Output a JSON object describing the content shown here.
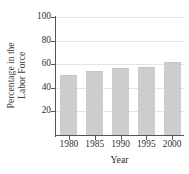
{
  "figure": {
    "caption": "Women in the Civilian Labor Force",
    "background_color": "#ffffff"
  },
  "chart_data": {
    "type": "bar",
    "title": "Women in the Civilian Labor Force",
    "xlabel": "Year",
    "ylabel": "Percentage in the Labor Force",
    "ylabel_line1": "Percentage in the",
    "ylabel_line2": "Labor Force",
    "categories": [
      "1980",
      "1985",
      "1990",
      "1995",
      "2000"
    ],
    "values": [
      51,
      54,
      56.5,
      57.5,
      62
    ],
    "ylim": [
      0,
      100
    ],
    "ytick_labels": [
      "100",
      "80",
      "60",
      "40",
      "20"
    ],
    "ytick_values": [
      100,
      80,
      60,
      40,
      20
    ],
    "grid": true,
    "grid_axis": "y",
    "legend": null,
    "bar_color": "#cdcdcd",
    "axis_color": "#56565a",
    "grid_color": "#e4e4e4",
    "text_color": "#2f2f2f"
  }
}
